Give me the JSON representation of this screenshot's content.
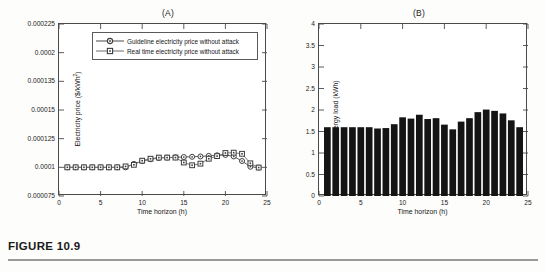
{
  "figure": {
    "caption_label": "FIGURE 10.9",
    "panel_a_title": "(A)",
    "panel_b_title": "(B)"
  },
  "colors": {
    "axis": "#4a4a4a",
    "guideline_series": "#5a5a5a",
    "realtime_series": "#7a7a7a",
    "bar_fill": "#141414",
    "background": "#ffffff"
  },
  "panel_a": {
    "legend": {
      "items": [
        {
          "label": "Guideline electricity price without attack",
          "marker": "circle"
        },
        {
          "label": "Real time electricity price without attack",
          "marker": "square"
        }
      ]
    },
    "ylabel_text": "Electricity price ($/kWh",
    "ylabel_sup": "2",
    "ylabel_tail": ")",
    "xlabel": "Time horizon (h)",
    "yticks": [
      "0.000075",
      "0.0001",
      "0.000125",
      "0.00015",
      "0.000135",
      "0.0002",
      "0.000225"
    ],
    "xticks": [
      "0",
      "5",
      "10",
      "15",
      "20",
      "25"
    ]
  },
  "panel_b": {
    "ylabel": "Energy load (kWh)",
    "xlabel": "Time horizon (h)",
    "yticks": [
      "0",
      "0.5",
      "1",
      "1.5",
      "2",
      "2.5",
      "3",
      "3.5",
      "4"
    ],
    "xticks": [
      "0",
      "5",
      "10",
      "15",
      "20",
      "25"
    ]
  },
  "chart_data": [
    {
      "type": "line",
      "title": "(A)",
      "xlabel": "Time horizon (h)",
      "ylabel": "Electricity price ($/kWh^2)",
      "xlim": [
        0,
        25
      ],
      "ylim": [
        7.5e-05,
        0.000225
      ],
      "ytick_values": [
        7.5e-05,
        0.0001,
        0.000125,
        0.00015,
        0.000175,
        0.0002,
        0.000225
      ],
      "ytick_labels": [
        "0.000075",
        "0.0001",
        "0.000125",
        "0.00015",
        "0.000135",
        "0.0002",
        "0.000225"
      ],
      "xtick_values": [
        0,
        5,
        10,
        15,
        20,
        25
      ],
      "grid": false,
      "legend_position": "top-center",
      "x": [
        1,
        2,
        3,
        4,
        5,
        6,
        7,
        8,
        9,
        10,
        11,
        12,
        13,
        14,
        15,
        16,
        17,
        18,
        19,
        20,
        21,
        22,
        23,
        24
      ],
      "series": [
        {
          "name": "Guideline electricity price without attack",
          "marker": "circle",
          "values": [
            0.0001,
            0.0001,
            0.0001,
            0.0001,
            0.0001,
            0.0001,
            0.0001,
            0.0001,
            0.000103,
            0.0001055,
            0.000107,
            0.0001082,
            0.0001085,
            0.0001088,
            0.000109,
            0.0001092,
            0.0001095,
            0.00011,
            0.0001105,
            0.0001108,
            0.0001095,
            0.0001055,
            0.0001005,
            9.98e-05
          ]
        },
        {
          "name": "Real time electricity price without attack",
          "marker": "square",
          "values": [
            0.0001,
            0.0001,
            0.0001,
            0.0001,
            0.0001,
            0.0001,
            0.0001,
            0.0001008,
            0.0001022,
            0.0001058,
            0.0001075,
            0.0001085,
            0.0001085,
            0.0001085,
            0.0001042,
            0.0001018,
            0.0001032,
            0.0001075,
            0.0001098,
            0.0001125,
            0.0001128,
            0.0001118,
            0.0001035,
            9.98e-05
          ]
        }
      ]
    },
    {
      "type": "bar",
      "title": "(B)",
      "xlabel": "Time horizon (h)",
      "ylabel": "Energy load (kWh)",
      "xlim": [
        0,
        25
      ],
      "ylim": [
        0,
        4
      ],
      "ytick_values": [
        0,
        0.5,
        1,
        1.5,
        2,
        2.5,
        3,
        3.5,
        4
      ],
      "xtick_values": [
        0,
        5,
        10,
        15,
        20,
        25
      ],
      "grid": false,
      "categories": [
        1,
        2,
        3,
        4,
        5,
        6,
        7,
        8,
        9,
        10,
        11,
        12,
        13,
        14,
        15,
        16,
        17,
        18,
        19,
        20,
        21,
        22,
        23,
        24
      ],
      "values": [
        1.6,
        1.6,
        1.6,
        1.6,
        1.6,
        1.6,
        1.57,
        1.58,
        1.67,
        1.83,
        1.8,
        1.89,
        1.79,
        1.81,
        1.66,
        1.55,
        1.73,
        1.81,
        1.95,
        2.01,
        1.98,
        1.92,
        1.76,
        1.6
      ]
    }
  ]
}
